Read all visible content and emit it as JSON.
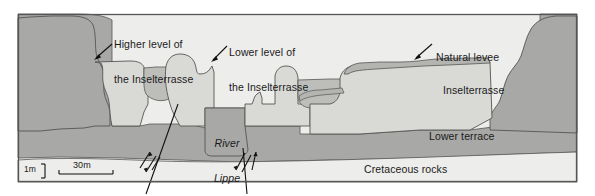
{
  "figure": {
    "type": "geological-cross-section",
    "frame_border_color": "#555555",
    "background_color": "#ffffff"
  },
  "palette": {
    "cretaceous_rocks": "#ededeb",
    "lower_terrace": "#a8a8a6",
    "inselterrasse": "#d9d9d6",
    "channel_fill": "#bdbdba",
    "natural_levee": "#b4b4b1",
    "outline": "#555555",
    "text": "#1a1a1a"
  },
  "callouts": [
    {
      "id": "higher-level",
      "line1": "Higher level of",
      "line2": "the Inselterrasse"
    },
    {
      "id": "lower-level",
      "line1": "Lower level of",
      "line2": "the Inselterrasse"
    },
    {
      "id": "natural-levee",
      "line1": "Natural levee",
      "line2": ""
    }
  ],
  "unit_labels": [
    {
      "id": "inselterrasse",
      "text": "Inselterrasse"
    },
    {
      "id": "lower-terrace",
      "text": "Lower terrace"
    },
    {
      "id": "cretaceous-rocks",
      "text": "Cretaceous rocks"
    }
  ],
  "river": {
    "line1": "River",
    "line2": "Lippe"
  },
  "scale": {
    "vertical_label": "1m",
    "horizontal_label": "30m"
  }
}
